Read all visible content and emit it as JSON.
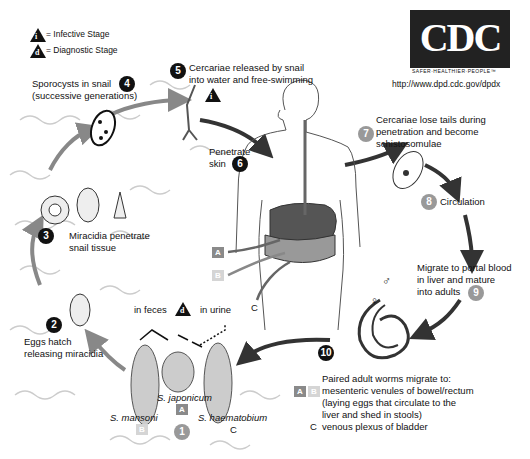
{
  "legend": {
    "infective": {
      "symbol": "i",
      "label": "= Infective Stage"
    },
    "diagnostic": {
      "symbol": "d",
      "label": "= Diagnostic Stage"
    }
  },
  "logo": {
    "text": "CDC",
    "tagline": "SAFER·HEALTHIER·PEOPLE™",
    "url": "http://www.dpd.cdc.gov/dpdx"
  },
  "stages": [
    {
      "num": "1",
      "style": "grey",
      "label": ""
    },
    {
      "num": "2",
      "style": "dark",
      "label_lines": [
        "Eggs hatch",
        "releasing miracidia"
      ]
    },
    {
      "num": "3",
      "style": "dark",
      "label_lines": [
        "Miracidia penetrate",
        "snail tissue"
      ]
    },
    {
      "num": "4",
      "style": "dark",
      "label_lines": [
        "Sporocysts in snail",
        "(successive generations)"
      ]
    },
    {
      "num": "5",
      "style": "dark",
      "label_lines": [
        "Cercariae released by snail",
        "into water and free-swimming"
      ]
    },
    {
      "num": "6",
      "style": "dark",
      "label_lines": [
        "Penetrate",
        "skin"
      ]
    },
    {
      "num": "7",
      "style": "grey",
      "label_lines": [
        "Cercariae lose tails during",
        "penetration and become",
        "schistosomulae"
      ]
    },
    {
      "num": "8",
      "style": "grey",
      "label_lines": [
        "Circulation"
      ]
    },
    {
      "num": "9",
      "style": "grey",
      "label_lines": [
        "Migrate to portal blood",
        "in liver and mature",
        "into adults"
      ]
    },
    {
      "num": "10",
      "style": "dark",
      "label_lines": [
        "Paired adult worms migrate to:"
      ]
    }
  ],
  "stage10_details": {
    "ab_line": "mesenteric venules of bowel/rectum",
    "ab_note_lines": [
      "(laying eggs that circulate to the",
      "liver and shed in stools)"
    ],
    "c_letter": "C",
    "c_line": "venous plexus of bladder"
  },
  "eggs": {
    "in_feces": "in feces",
    "in_urine": "in urine",
    "species": [
      {
        "name": "S. mansoni",
        "tag": "B"
      },
      {
        "name": "S. japonicum",
        "tag": "A"
      },
      {
        "name": "S. haematobium",
        "tag": "C"
      }
    ]
  },
  "body_labels": {
    "a": "A",
    "b": "B",
    "c": "C"
  },
  "symbols": {
    "female": "♀",
    "male": "♂"
  },
  "colors": {
    "dark": "#111111",
    "grey": "#999999",
    "box_a": "#8a8a8a",
    "box_b": "#d5d5d5",
    "arrow_dark": "#333333",
    "arrow_grey": "#888888"
  }
}
